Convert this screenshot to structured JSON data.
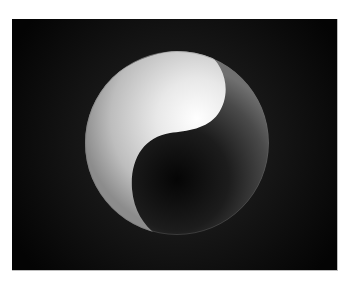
{
  "image": {
    "subject": "yin-yang sphere",
    "background_color": "#ffffff",
    "panel": {
      "background_color": "#050505",
      "glow_color": "#2a2a2a"
    },
    "sphere": {
      "light_half_color_center": "#ffffff",
      "light_half_color_edge": "#8a8a8a",
      "dark_half_color_center": "#050505",
      "dark_half_color_edge": "#6a6a6a"
    }
  }
}
